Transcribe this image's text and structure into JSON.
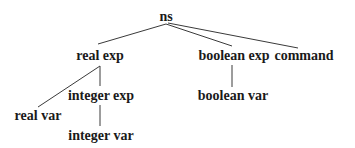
{
  "diagram": {
    "type": "tree",
    "nodes": {
      "ns": {
        "label": "ns",
        "x": 166,
        "y": 17
      },
      "real_exp": {
        "label": "real exp",
        "x": 100,
        "y": 56
      },
      "boolean_exp": {
        "label": "boolean exp",
        "x": 234,
        "y": 56
      },
      "command": {
        "label": "command",
        "x": 304,
        "y": 56
      },
      "integer_exp": {
        "label": "integer exp",
        "x": 101,
        "y": 96
      },
      "boolean_var": {
        "label": "boolean var",
        "x": 233,
        "y": 96
      },
      "real_var": {
        "label": "real var",
        "x": 38,
        "y": 116
      },
      "integer_var": {
        "label": "integer var",
        "x": 101,
        "y": 136
      }
    },
    "edges": [
      {
        "from": "ns",
        "to": "real_exp",
        "x1": 166,
        "y1": 24,
        "x2": 98,
        "y2": 44
      },
      {
        "from": "ns",
        "to": "boolean_exp",
        "x1": 166,
        "y1": 24,
        "x2": 232,
        "y2": 46
      },
      {
        "from": "ns",
        "to": "command",
        "x1": 168,
        "y1": 23,
        "x2": 298,
        "y2": 48
      },
      {
        "from": "real_exp",
        "to": "real_var",
        "x1": 100,
        "y1": 66,
        "x2": 38,
        "y2": 107
      },
      {
        "from": "real_exp",
        "to": "integer_exp",
        "x1": 100,
        "y1": 66,
        "x2": 100,
        "y2": 86
      },
      {
        "from": "integer_exp",
        "to": "integer_var",
        "x1": 100,
        "y1": 105,
        "x2": 100,
        "y2": 126
      },
      {
        "from": "boolean_exp",
        "to": "boolean_var",
        "x1": 232,
        "y1": 65,
        "x2": 232,
        "y2": 87
      }
    ]
  }
}
